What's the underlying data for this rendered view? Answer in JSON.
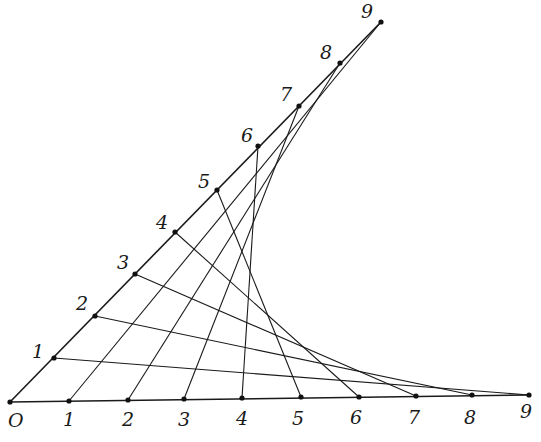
{
  "diagram": {
    "type": "string-art-envelope",
    "origin": {
      "label": "O",
      "x": 10,
      "y": 402,
      "label_x": 8,
      "label_y": 427
    },
    "horizontal_points": [
      {
        "label": "1",
        "x": 69,
        "y": 401,
        "label_x": 63,
        "label_y": 426
      },
      {
        "label": "2",
        "x": 128,
        "y": 400,
        "label_x": 122,
        "label_y": 426
      },
      {
        "label": "3",
        "x": 184,
        "y": 399,
        "label_x": 178,
        "label_y": 426
      },
      {
        "label": "4",
        "x": 242,
        "y": 398,
        "label_x": 236,
        "label_y": 425
      },
      {
        "label": "5",
        "x": 301,
        "y": 397,
        "label_x": 292,
        "label_y": 425
      },
      {
        "label": "6",
        "x": 359,
        "y": 397,
        "label_x": 350,
        "label_y": 424
      },
      {
        "label": "7",
        "x": 416,
        "y": 396,
        "label_x": 408,
        "label_y": 424
      },
      {
        "label": "8",
        "x": 472,
        "y": 395,
        "label_x": 464,
        "label_y": 424
      },
      {
        "label": "9",
        "x": 529,
        "y": 395,
        "label_x": 520,
        "label_y": 418
      }
    ],
    "diagonal_points": [
      {
        "label": "1",
        "x": 54,
        "y": 358,
        "label_x": 32,
        "label_y": 358
      },
      {
        "label": "2",
        "x": 95,
        "y": 316,
        "label_x": 76,
        "label_y": 310
      },
      {
        "label": "3",
        "x": 135,
        "y": 274,
        "label_x": 117,
        "label_y": 269
      },
      {
        "label": "4",
        "x": 175,
        "y": 232,
        "label_x": 156,
        "label_y": 229
      },
      {
        "label": "5",
        "x": 217,
        "y": 190,
        "label_x": 198,
        "label_y": 188
      },
      {
        "label": "6",
        "x": 258,
        "y": 146,
        "label_x": 241,
        "label_y": 142
      },
      {
        "label": "7",
        "x": 299,
        "y": 106,
        "label_x": 280,
        "label_y": 101
      },
      {
        "label": "8",
        "x": 340,
        "y": 63,
        "label_x": 320,
        "label_y": 59
      },
      {
        "label": "9",
        "x": 381,
        "y": 22,
        "label_x": 361,
        "label_y": 18
      }
    ],
    "connections_rule": "diagonal k -> horizontal (10-k)",
    "colors": {
      "ink": "#1a1a1a",
      "background": "#ffffff"
    }
  }
}
